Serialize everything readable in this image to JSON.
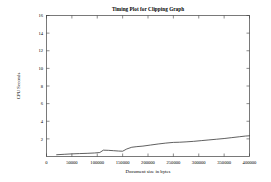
{
  "chart_data": {
    "type": "line",
    "title": "Timing Plot for Clipping Graph",
    "xlabel": "Document size in bytes",
    "ylabel": "CPU Seconds",
    "xlim": [
      0,
      400000
    ],
    "ylim": [
      0,
      16
    ],
    "grid": false,
    "legend": "none",
    "xticks": [
      0,
      50000,
      100000,
      150000,
      200000,
      250000,
      300000,
      350000,
      400000
    ],
    "xtick_labels": [
      "0",
      "50000",
      "100000",
      "150000",
      "200000",
      "250000",
      "300000",
      "350000",
      "400000"
    ],
    "yticks": [
      2,
      4,
      6,
      8,
      10,
      12,
      14,
      16
    ],
    "ytick_labels": [
      "2",
      "4",
      "6",
      "8",
      "10",
      "12",
      "14",
      "16"
    ],
    "series": [
      {
        "name": "clipping",
        "x": [
          20000,
          35000,
          50000,
          65000,
          80000,
          95000,
          105000,
          112000,
          122000,
          132000,
          142000,
          150000,
          158000,
          168000,
          178000,
          190000,
          205000,
          220000,
          235000,
          250000,
          262000,
          275000,
          290000,
          305000,
          320000,
          335000,
          350000,
          365000,
          380000,
          392000,
          400000
        ],
        "y": [
          0.2,
          0.25,
          0.3,
          0.33,
          0.36,
          0.4,
          0.45,
          0.72,
          0.7,
          0.66,
          0.62,
          0.6,
          0.85,
          1.05,
          1.12,
          1.18,
          1.3,
          1.42,
          1.52,
          1.6,
          1.62,
          1.66,
          1.72,
          1.8,
          1.88,
          1.96,
          2.04,
          2.14,
          2.24,
          2.32,
          2.35
        ]
      }
    ]
  }
}
